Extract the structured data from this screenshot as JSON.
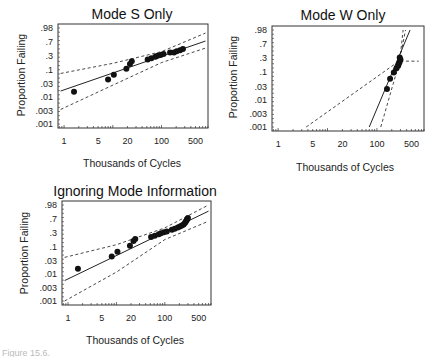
{
  "chart_data": [
    {
      "type": "scatter",
      "subtype": "weibull-probability-plot",
      "title": "Mode S Only",
      "xlabel": "Thousands of Cycles",
      "ylabel": "Proportion Failing",
      "x_scale": "log",
      "y_scale": "weibull",
      "x_ticks": [
        1,
        5,
        20,
        100,
        500
      ],
      "x_tick_labels": [
        "1",
        "5",
        "20",
        "100",
        "500"
      ],
      "y_ticks": [
        0.98,
        0.7,
        0.3,
        0.1,
        0.03,
        0.01,
        0.003,
        0.001
      ],
      "y_tick_labels": [
        ".98",
        ".7",
        ".3",
        ".1",
        ".03",
        ".01",
        ".003",
        ".001"
      ],
      "xlim": [
        0.75,
        900
      ],
      "ylim": [
        0.001,
        0.98
      ],
      "grid": false,
      "points": [
        {
          "x": 1.6,
          "y": 0.016
        },
        {
          "x": 8.0,
          "y": 0.045
        },
        {
          "x": 10.5,
          "y": 0.068
        },
        {
          "x": 19,
          "y": 0.11
        },
        {
          "x": 22.5,
          "y": 0.16
        },
        {
          "x": 24.5,
          "y": 0.2
        },
        {
          "x": 52,
          "y": 0.23
        },
        {
          "x": 62,
          "y": 0.25
        },
        {
          "x": 75,
          "y": 0.28
        },
        {
          "x": 83,
          "y": 0.3
        },
        {
          "x": 96,
          "y": 0.32
        },
        {
          "x": 110,
          "y": 0.34
        },
        {
          "x": 150,
          "y": 0.38
        },
        {
          "x": 180,
          "y": 0.38
        },
        {
          "x": 205,
          "y": 0.41
        },
        {
          "x": 240,
          "y": 0.44
        },
        {
          "x": 275,
          "y": 0.47
        }
      ],
      "fit_line": [
        {
          "x": 0.85,
          "y": 0.017
        },
        {
          "x": 800,
          "y": 0.72
        }
      ],
      "lower_band": [
        {
          "x": 0.85,
          "y": 0.0035
        },
        {
          "x": 10,
          "y": 0.028
        },
        {
          "x": 100,
          "y": 0.18
        },
        {
          "x": 800,
          "y": 0.5
        }
      ],
      "upper_band": [
        {
          "x": 0.85,
          "y": 0.075
        },
        {
          "x": 10,
          "y": 0.17
        },
        {
          "x": 100,
          "y": 0.4
        },
        {
          "x": 800,
          "y": 0.92
        }
      ]
    },
    {
      "type": "scatter",
      "subtype": "weibull-probability-plot",
      "title": "Mode W Only",
      "xlabel": "Thousands of Cycles",
      "ylabel": "Proportion Failing",
      "x_scale": "log",
      "y_scale": "weibull",
      "x_ticks": [
        1,
        5,
        20,
        100,
        500
      ],
      "x_tick_labels": [
        "1",
        "5",
        "20",
        "100",
        "500"
      ],
      "y_ticks": [
        0.98,
        0.7,
        0.3,
        0.1,
        0.03,
        0.01,
        0.003,
        0.001
      ],
      "y_tick_labels": [
        ".98",
        ".7",
        ".3",
        ".1",
        ".03",
        ".01",
        ".003",
        ".001"
      ],
      "xlim": [
        0.75,
        900
      ],
      "ylim": [
        0.001,
        0.98
      ],
      "grid": false,
      "points": [
        {
          "x": 160,
          "y": 0.025
        },
        {
          "x": 185,
          "y": 0.06
        },
        {
          "x": 220,
          "y": 0.1
        },
        {
          "x": 250,
          "y": 0.14
        },
        {
          "x": 270,
          "y": 0.17
        },
        {
          "x": 280,
          "y": 0.2
        },
        {
          "x": 290,
          "y": 0.23
        },
        {
          "x": 300,
          "y": 0.27
        },
        {
          "x": 290,
          "y": 0.31
        }
      ],
      "fit_line": [
        {
          "x": 70,
          "y": 0.001
        },
        {
          "x": 470,
          "y": 0.98
        }
      ],
      "lower_band": [
        {
          "x": 120,
          "y": 0.001
        },
        {
          "x": 280,
          "y": 0.2
        },
        {
          "x": 380,
          "y": 0.98
        }
      ],
      "upper_band": [
        {
          "x": 3.7,
          "y": 0.001
        },
        {
          "x": 290,
          "y": 0.25
        },
        {
          "x": 340,
          "y": 0.98
        }
      ],
      "horizontal_dashed": {
        "y": 0.24,
        "x_from": 300,
        "x_to": 700
      }
    },
    {
      "type": "scatter",
      "subtype": "weibull-probability-plot",
      "title": "Ignoring Mode Information",
      "xlabel": "Thousands of Cycles",
      "ylabel": "Proportion Failing",
      "x_scale": "log",
      "y_scale": "weibull",
      "x_ticks": [
        1,
        5,
        20,
        100,
        500
      ],
      "x_tick_labels": [
        "1",
        "5",
        "20",
        "100",
        "500"
      ],
      "y_ticks": [
        0.98,
        0.7,
        0.3,
        0.1,
        0.03,
        0.01,
        0.003,
        0.001
      ],
      "y_tick_labels": [
        ".98",
        ".7",
        ".3",
        ".1",
        ".03",
        ".01",
        ".003",
        ".001"
      ],
      "xlim": [
        0.75,
        900
      ],
      "ylim": [
        0.001,
        0.98
      ],
      "grid": false,
      "points": [
        {
          "x": 1.6,
          "y": 0.016
        },
        {
          "x": 8.0,
          "y": 0.045
        },
        {
          "x": 10.5,
          "y": 0.068
        },
        {
          "x": 19,
          "y": 0.11
        },
        {
          "x": 22.5,
          "y": 0.16
        },
        {
          "x": 24.5,
          "y": 0.19
        },
        {
          "x": 52,
          "y": 0.22
        },
        {
          "x": 62,
          "y": 0.24
        },
        {
          "x": 75,
          "y": 0.27
        },
        {
          "x": 83,
          "y": 0.29
        },
        {
          "x": 96,
          "y": 0.31
        },
        {
          "x": 110,
          "y": 0.33
        },
        {
          "x": 140,
          "y": 0.37
        },
        {
          "x": 160,
          "y": 0.4
        },
        {
          "x": 185,
          "y": 0.43
        },
        {
          "x": 205,
          "y": 0.46
        },
        {
          "x": 225,
          "y": 0.49
        },
        {
          "x": 245,
          "y": 0.52
        },
        {
          "x": 260,
          "y": 0.56
        },
        {
          "x": 270,
          "y": 0.6
        },
        {
          "x": 280,
          "y": 0.64
        },
        {
          "x": 290,
          "y": 0.68
        },
        {
          "x": 300,
          "y": 0.72
        }
      ],
      "fit_line": [
        {
          "x": 0.85,
          "y": 0.0058
        },
        {
          "x": 800,
          "y": 0.9
        }
      ],
      "lower_band": [
        {
          "x": 0.85,
          "y": 0.001
        },
        {
          "x": 10,
          "y": 0.012
        },
        {
          "x": 100,
          "y": 0.18
        },
        {
          "x": 800,
          "y": 0.62
        }
      ],
      "upper_band": [
        {
          "x": 0.85,
          "y": 0.042
        },
        {
          "x": 10,
          "y": 0.12
        },
        {
          "x": 100,
          "y": 0.42
        },
        {
          "x": 800,
          "y": 0.98
        }
      ]
    }
  ],
  "panels": [
    {
      "title": "Mode S Only",
      "xlabel": "Thousands of Cycles",
      "ylabel": "Proportion Failing",
      "box": {
        "x": 58,
        "y": 24,
        "w": 150,
        "h": 104
      }
    },
    {
      "title": "Mode W Only",
      "xlabel": "Thousands of Cycles",
      "ylabel": "Proportion Failing",
      "box": {
        "x": 272,
        "y": 26,
        "w": 152,
        "h": 105
      }
    },
    {
      "title": "Ignoring Mode Information",
      "xlabel": "Thousands of Cycles",
      "ylabel": "Proportion Failing",
      "box": {
        "x": 62,
        "y": 201,
        "w": 149,
        "h": 104
      }
    }
  ],
  "caption": "Figure 15.6."
}
